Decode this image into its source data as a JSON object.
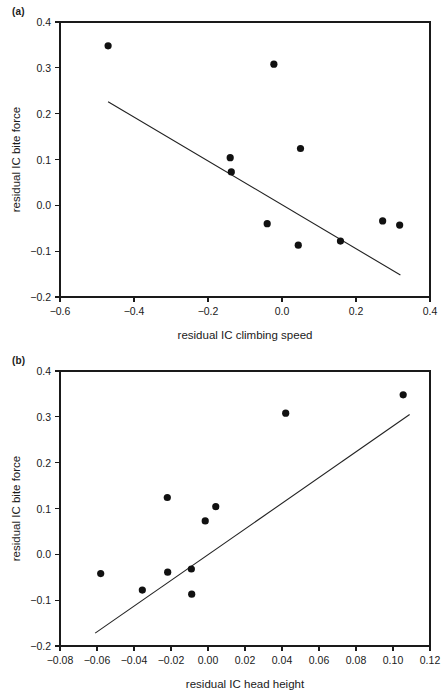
{
  "figure": {
    "background": "#ffffff",
    "ink": "#1a1a1a",
    "point_color": "#111111",
    "line_color": "#222222"
  },
  "panels": [
    {
      "id": "a",
      "label": "(a)",
      "chart_data": {
        "type": "scatter",
        "title": "",
        "xlabel": "residual IC climbing speed",
        "ylabel": "residual IC bite force",
        "xlim": [
          -0.6,
          0.4
        ],
        "ylim": [
          -0.2,
          0.4
        ],
        "xticks": [
          -0.6,
          -0.4,
          -0.2,
          0.0,
          0.2,
          0.4
        ],
        "xticklabels": [
          "−0.6",
          "−0.4",
          "−0.2",
          "0.0",
          "0.2",
          "0.4"
        ],
        "yticks": [
          -0.2,
          -0.1,
          0.0,
          0.1,
          0.2,
          0.3,
          0.4
        ],
        "yticklabels": [
          "−0.2",
          "−0.1",
          "0.0",
          "0.1",
          "0.2",
          "0.3",
          "0.4"
        ],
        "grid": false,
        "legend": "none",
        "x": [
          -0.47,
          -0.14,
          -0.137,
          -0.04,
          -0.022,
          0.044,
          0.05,
          0.158,
          0.272,
          0.318
        ],
        "y": [
          0.348,
          0.104,
          0.073,
          -0.04,
          0.308,
          -0.087,
          0.124,
          -0.078,
          -0.034,
          -0.043
        ],
        "fit_line": {
          "x_start": -0.47,
          "y_start": 0.226,
          "x_end": 0.32,
          "y_end": -0.152
        }
      }
    },
    {
      "id": "b",
      "label": "(b)",
      "chart_data": {
        "type": "scatter",
        "title": "",
        "xlabel": "residual IC head height",
        "ylabel": "residual IC bite force",
        "xlim": [
          -0.08,
          0.12
        ],
        "ylim": [
          -0.2,
          0.4
        ],
        "xticks": [
          -0.08,
          -0.06,
          -0.04,
          -0.02,
          0.0,
          0.02,
          0.04,
          0.06,
          0.08,
          0.1,
          0.12
        ],
        "xticklabels": [
          "−0.08",
          "−0.06",
          "−0.04",
          "−0.02",
          "0.00",
          "0.02",
          "0.04",
          "0.06",
          "0.08",
          "0.10",
          "0.12"
        ],
        "yticks": [
          -0.2,
          -0.1,
          0.0,
          0.1,
          0.2,
          0.3,
          0.4
        ],
        "yticklabels": [
          "−0.2",
          "−0.1",
          "0.0",
          "0.1",
          "0.2",
          "0.3",
          "0.4"
        ],
        "grid": false,
        "legend": "none",
        "x": [
          -0.058,
          -0.0355,
          -0.022,
          -0.0218,
          -0.009,
          -0.0088,
          -0.0015,
          0.0042,
          0.042,
          0.1055
        ],
        "y": [
          -0.042,
          -0.078,
          0.124,
          -0.039,
          -0.032,
          -0.087,
          0.073,
          0.104,
          0.308,
          0.348
        ],
        "fit_line": {
          "x_start": -0.061,
          "y_start": -0.172,
          "x_end": 0.109,
          "y_end": 0.305
        }
      }
    }
  ]
}
